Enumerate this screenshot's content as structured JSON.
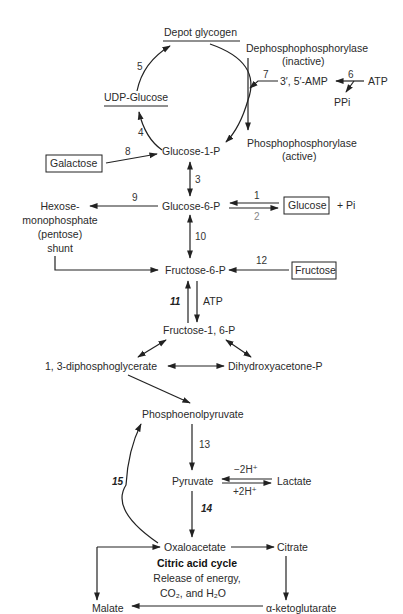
{
  "colors": {
    "ink": "#222222",
    "background": "#ffffff"
  },
  "nodes": {
    "depot_glycogen": "Depot glycogen",
    "dephospho_1": "Dephosphophosphorylase",
    "dephospho_2": "(inactive)",
    "camp": "3′, 5′-AMP",
    "atp_top": "ATP",
    "ppi": "PPi",
    "udp_glucose": "UDP-Glucose",
    "phospho_1": "Phosphophosphorylase",
    "phospho_2": "(active)",
    "galactose": "Galactose",
    "glucose_1p": "Glucose-1-P",
    "glucose_6p": "Glucose-6-P",
    "glucose": "Glucose",
    "pi": "+ Pi",
    "hmp_1": "Hexose-",
    "hmp_2": "monophosphate",
    "hmp_3": "(pentose)",
    "hmp_4": "shunt",
    "fructose_6p": "Fructose-6-P",
    "fructose": "Fructose",
    "atp_mid": "ATP",
    "fructose_16p": "Fructose-1, 6-P",
    "diphosphoglycerate": "1, 3-diphosphoglycerate",
    "dhap": "Dihydroxyacetone-P",
    "pep": "Phosphoenolpyruvate",
    "pyruvate": "Pyruvate",
    "lactate": "Lactate",
    "minus_2h": "−2H⁺",
    "plus_2h": "+2H⁺",
    "oxaloacetate": "Oxaloacetate",
    "citrate": "Citrate",
    "tca_title": "Citric acid cycle",
    "tca_line1": "Release of energy,",
    "tca_line2": "CO₂, and H₂O",
    "malate": "Malate",
    "akg": "α-ketoglutarate"
  },
  "steps": {
    "s1": "1",
    "s2": "2",
    "s3": "3",
    "s4": "4",
    "s5": "5",
    "s6": "6",
    "s7": "7",
    "s8": "8",
    "s9": "9",
    "s10": "10",
    "s11": "11",
    "s12": "12",
    "s13": "13",
    "s14": "14",
    "s15": "15"
  }
}
